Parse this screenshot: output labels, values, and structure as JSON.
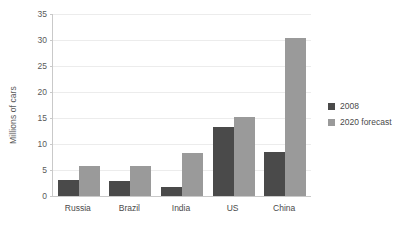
{
  "chart_data": {
    "type": "bar",
    "title": "",
    "xlabel": "",
    "ylabel": "Millions of cars",
    "ylim": [
      0,
      35
    ],
    "yticks": [
      0,
      5,
      10,
      15,
      20,
      25,
      30,
      35
    ],
    "grid": true,
    "legend_position": "right",
    "categories": [
      "Russia",
      "Brazil",
      "India",
      "US",
      "China"
    ],
    "series": [
      {
        "name": "2008",
        "color": "#4a4a4a",
        "values": [
          3.1,
          2.8,
          1.8,
          13.2,
          8.5
        ]
      },
      {
        "name": "2020 forecast",
        "color": "#9a9a9a",
        "values": [
          5.8,
          5.8,
          8.3,
          15.1,
          30.3
        ]
      }
    ]
  },
  "colors": {
    "background": "#ffffff",
    "gridline": "#ececec",
    "axis": "#c9c9c9",
    "text": "#4a4a4a",
    "tick_text": "#5a5a5a"
  }
}
